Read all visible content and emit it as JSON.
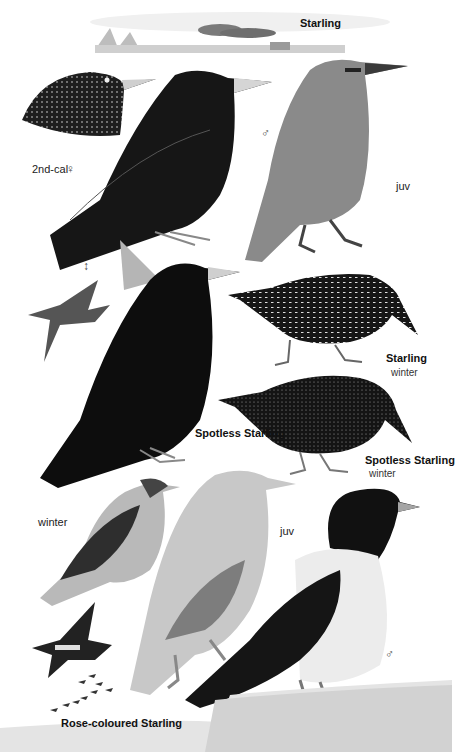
{
  "plate": {
    "title": "Starling",
    "labels": {
      "starling_top": "Starling",
      "second_cal_female": "2nd-cal",
      "female_symbol": "♀",
      "male_symbol_1": "♂",
      "juv_1": "juv",
      "starling_winter_name": "Starling",
      "starling_winter_sub": "winter",
      "spotless_starling": "Spotless Starling",
      "spotless_winter_name": "Spotless Starling",
      "spotless_winter_sub": "winter",
      "winter_rose": "winter",
      "juv_2": "juv",
      "male_symbol_2": "♂",
      "rose_coloured_starling": "Rose-coloured Starling"
    },
    "figures": [
      {
        "id": "flock-landscape",
        "desc": "Starling flock over reedbed landscape"
      },
      {
        "id": "starling-head-2nd-cal-female",
        "desc": "Starling head, 2nd-cal female, spotted"
      },
      {
        "id": "starling-male",
        "desc": "Starling adult male, glossy black"
      },
      {
        "id": "starling-juv",
        "desc": "Starling juvenile, brownish-grey"
      },
      {
        "id": "starling-flight",
        "desc": "Starling in flight"
      },
      {
        "id": "spotless-starling",
        "desc": "Spotless Starling adult, all black"
      },
      {
        "id": "starling-winter",
        "desc": "Starling winter, heavily spotted"
      },
      {
        "id": "spotless-starling-winter",
        "desc": "Spotless Starling winter, finely spotted"
      },
      {
        "id": "rose-coloured-winter",
        "desc": "Rose-coloured Starling winter"
      },
      {
        "id": "rose-coloured-juv",
        "desc": "Rose-coloured Starling juvenile, pale sandy"
      },
      {
        "id": "rose-coloured-male",
        "desc": "Rose-coloured Starling adult male, black and pink"
      },
      {
        "id": "rose-coloured-flight",
        "desc": "Rose-coloured Starling in flight"
      },
      {
        "id": "rose-coloured-flock",
        "desc": "Rose-coloured Starling flock"
      }
    ]
  }
}
